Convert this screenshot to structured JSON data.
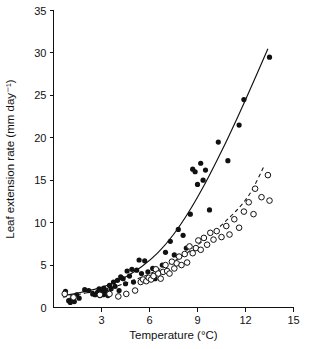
{
  "chart_data": {
    "type": "scatter",
    "title": "",
    "xlabel": "Temperature (°C)",
    "ylabel": "Leaf extension rate (mm day⁻¹)",
    "xlim": [
      0,
      15
    ],
    "ylim": [
      0,
      35
    ],
    "xticks": [
      0,
      3,
      6,
      9,
      12,
      15
    ],
    "xticklabels": [
      "0",
      "3",
      "6",
      "9",
      "12",
      "15"
    ],
    "yticks": [
      0,
      5,
      10,
      15,
      20,
      25,
      30,
      35
    ],
    "yticklabels": [
      "0",
      "5",
      "10",
      "15",
      "20",
      "25",
      "30",
      "35"
    ],
    "grid": false,
    "legend": "none",
    "series": [
      {
        "name": "filled-circles",
        "marker": "filled-circle",
        "color": "#111111",
        "points": [
          [
            0.75,
            1.9
          ],
          [
            0.95,
            0.8
          ],
          [
            1.05,
            0.6
          ],
          [
            1.15,
            1.0
          ],
          [
            1.3,
            0.7
          ],
          [
            1.45,
            1.5
          ],
          [
            1.6,
            1.1
          ],
          [
            1.95,
            2.1
          ],
          [
            2.2,
            2.0
          ],
          [
            2.45,
            1.6
          ],
          [
            2.6,
            1.5
          ],
          [
            2.75,
            1.8
          ],
          [
            2.85,
            2.2
          ],
          [
            2.9,
            1.4
          ],
          [
            3.0,
            1.7
          ],
          [
            3.05,
            2.0
          ],
          [
            3.1,
            1.5
          ],
          [
            3.15,
            2.3
          ],
          [
            3.2,
            1.6
          ],
          [
            3.3,
            1.9
          ],
          [
            3.4,
            1.4
          ],
          [
            3.5,
            2.6
          ],
          [
            3.6,
            2.2
          ],
          [
            3.75,
            3.0
          ],
          [
            3.85,
            2.5
          ],
          [
            4.0,
            3.2
          ],
          [
            4.1,
            2.0
          ],
          [
            4.2,
            3.6
          ],
          [
            4.35,
            3.4
          ],
          [
            4.5,
            2.8
          ],
          [
            4.6,
            4.3
          ],
          [
            4.75,
            3.7
          ],
          [
            4.9,
            4.5
          ],
          [
            5.0,
            3.0
          ],
          [
            5.2,
            4.4
          ],
          [
            5.35,
            5.6
          ],
          [
            5.5,
            4.0
          ],
          [
            5.7,
            5.5
          ],
          [
            5.9,
            4.2
          ],
          [
            6.05,
            3.5
          ],
          [
            6.2,
            4.6
          ],
          [
            6.35,
            3.4
          ],
          [
            6.5,
            4.2
          ],
          [
            6.8,
            5.0
          ],
          [
            7.0,
            6.5
          ],
          [
            7.3,
            7.8
          ],
          [
            7.55,
            6.2
          ],
          [
            7.8,
            9.2
          ],
          [
            8.1,
            8.5
          ],
          [
            8.3,
            7.0
          ],
          [
            8.55,
            11.0
          ],
          [
            8.7,
            16.3
          ],
          [
            8.85,
            16.0
          ],
          [
            9.0,
            14.5
          ],
          [
            9.2,
            17.0
          ],
          [
            9.35,
            15.0
          ],
          [
            9.5,
            16.2
          ],
          [
            9.75,
            11.5
          ],
          [
            10.3,
            19.5
          ],
          [
            10.9,
            17.3
          ],
          [
            11.6,
            21.5
          ],
          [
            11.9,
            24.5
          ],
          [
            13.5,
            29.5
          ]
        ]
      },
      {
        "name": "open-circles",
        "marker": "open-circle",
        "color": "#111111",
        "points": [
          [
            0.7,
            1.6
          ],
          [
            1.25,
            1.2
          ],
          [
            2.9,
            1.5
          ],
          [
            3.5,
            1.6
          ],
          [
            4.05,
            1.3
          ],
          [
            4.55,
            1.6
          ],
          [
            5.1,
            2.0
          ],
          [
            5.45,
            3.0
          ],
          [
            5.6,
            3.3
          ],
          [
            5.8,
            3.1
          ],
          [
            5.95,
            3.5
          ],
          [
            6.1,
            3.3
          ],
          [
            6.25,
            3.7
          ],
          [
            6.4,
            4.5
          ],
          [
            6.55,
            4.0
          ],
          [
            6.7,
            3.4
          ],
          [
            6.85,
            4.2
          ],
          [
            7.0,
            5.0
          ],
          [
            7.1,
            4.3
          ],
          [
            7.25,
            4.0
          ],
          [
            7.4,
            5.4
          ],
          [
            7.55,
            4.6
          ],
          [
            7.7,
            5.2
          ],
          [
            7.85,
            6.0
          ],
          [
            8.0,
            5.0
          ],
          [
            8.2,
            6.3
          ],
          [
            8.35,
            5.3
          ],
          [
            8.5,
            7.2
          ],
          [
            8.7,
            6.4
          ],
          [
            8.9,
            7.0
          ],
          [
            9.05,
            7.9
          ],
          [
            9.2,
            6.8
          ],
          [
            9.4,
            8.2
          ],
          [
            9.6,
            7.4
          ],
          [
            9.8,
            8.8
          ],
          [
            10.0,
            8.0
          ],
          [
            10.2,
            9.0
          ],
          [
            10.5,
            8.3
          ],
          [
            10.8,
            9.6
          ],
          [
            11.0,
            8.6
          ],
          [
            11.3,
            10.4
          ],
          [
            11.6,
            9.4
          ],
          [
            11.9,
            11.3
          ],
          [
            12.2,
            12.4
          ],
          [
            12.5,
            11.0
          ],
          [
            12.6,
            14.0
          ],
          [
            13.0,
            13.0
          ],
          [
            13.4,
            15.6
          ],
          [
            13.5,
            12.6
          ]
        ]
      }
    ],
    "fitted_curves": [
      {
        "name": "solid-exponential-fit",
        "style": "solid",
        "for_series": "filled-circles",
        "points": [
          [
            0.6,
            1.4
          ],
          [
            1.5,
            1.7
          ],
          [
            2.5,
            2.1
          ],
          [
            3.5,
            2.7
          ],
          [
            4.5,
            3.6
          ],
          [
            5.5,
            4.8
          ],
          [
            6.5,
            6.4
          ],
          [
            7.5,
            8.6
          ],
          [
            8.5,
            11.4
          ],
          [
            9.5,
            14.7
          ],
          [
            10.5,
            18.4
          ],
          [
            11.5,
            22.4
          ],
          [
            12.5,
            26.6
          ],
          [
            13.4,
            30.5
          ]
        ]
      },
      {
        "name": "dashed-exponential-fit",
        "style": "dashed",
        "for_series": "open-circles",
        "points": [
          [
            0.6,
            1.2
          ],
          [
            2.0,
            1.7
          ],
          [
            3.5,
            2.3
          ],
          [
            5.0,
            3.2
          ],
          [
            6.5,
            4.4
          ],
          [
            8.0,
            6.0
          ],
          [
            9.5,
            8.1
          ],
          [
            11.0,
            10.6
          ],
          [
            12.2,
            13.2
          ],
          [
            13.2,
            16.8
          ]
        ]
      }
    ]
  },
  "axes": {
    "x_title": "Temperature (°C)",
    "y_title": "Leaf extension rate (mm day⁻¹)"
  },
  "colors": {
    "ink": "#111111",
    "background": "#ffffff"
  }
}
